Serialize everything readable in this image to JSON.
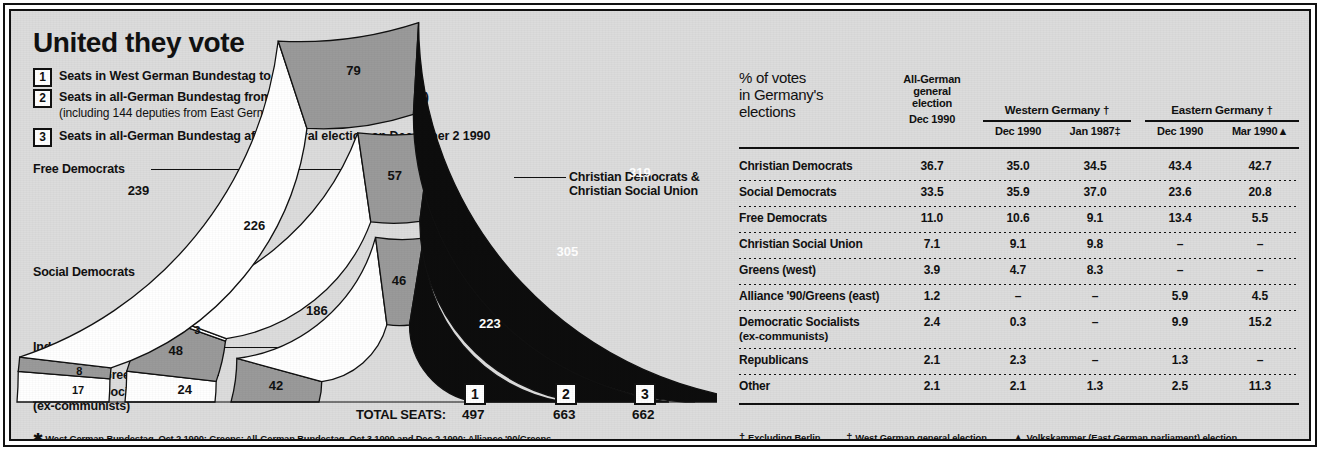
{
  "title": "United they vote",
  "key": [
    {
      "num": "1",
      "text": "Seats in West German Bundestag to October 2 1990",
      "sub": ""
    },
    {
      "num": "2",
      "text": "Seats in all-German Bundestag from October 3 1990 (unity day)",
      "sub": "(including 144 deputies from East Germany)"
    },
    {
      "num": "3",
      "text": "Seats in all-German Bundestag after general election on December 2 1990",
      "sub": ""
    }
  ],
  "chart_labels": {
    "free_democrats": "Free Democrats",
    "social_democrats": "Social Democrats",
    "independents": "Independents",
    "alliance_greens": "Alliance '90/Greens *",
    "democratic_socialists": "Democratic Socialists",
    "democratic_socialists_sub": "(ex-communists)",
    "christian_line1": "Christian Democrats &",
    "christian_line2": "Christian Social Union"
  },
  "total_seats_label": "TOTAL SEATS:",
  "ring_badges": [
    "1",
    "2",
    "3"
  ],
  "ring_totals": [
    "497",
    "663",
    "662"
  ],
  "left_footnote": "West German Bundestag, Oct 2 1990: Greens; All-German Bundestag, Oct 3 1990 and Dec 2 1990: Alliance '90/Greens",
  "left_footnote_marker": "✱",
  "chart_data": {
    "type": "pie",
    "title": "United they vote",
    "subtype": "nested half-donut (parliament seat shares)",
    "units": "seats",
    "rings": [
      {
        "badge": "1",
        "name": "Seats in West German Bundestag to October 2 1990",
        "total": 497,
        "radius_order": "inner",
        "segments": [
          {
            "label": "Democratic Socialists (ex-communists)",
            "value": 0,
            "display": "",
            "color": "#ffffff"
          },
          {
            "label": "Alliance '90/Greens",
            "value": 0,
            "display": "",
            "color": "#9a9a9a"
          },
          {
            "label": "Independents",
            "value": 0,
            "display": "",
            "color": "#ffffff"
          },
          {
            "label": "Greens / Alliance '90/Greens",
            "value": 42,
            "display": "42",
            "color": "#9a9a9a"
          },
          {
            "label": "Social Democrats",
            "value": 186,
            "display": "186",
            "color": "#ffffff"
          },
          {
            "label": "Free Democrats",
            "value": 46,
            "display": "46",
            "color": "#9a9a9a"
          },
          {
            "label": "Christian Democrats & Christian Social Union",
            "value": 223,
            "display": "223",
            "color": "#0d0d0d"
          }
        ]
      },
      {
        "badge": "2",
        "name": "Seats in all-German Bundestag from October 3 1990 (unity day)",
        "total": 663,
        "radius_order": "middle",
        "segments": [
          {
            "label": "Democratic Socialists (ex-communists)",
            "value": 24,
            "display": "24",
            "color": "#ffffff"
          },
          {
            "label": "Alliance '90/Greens",
            "value": 48,
            "display": "48",
            "color": "#9a9a9a"
          },
          {
            "label": "Independents",
            "value": 3,
            "display": "3",
            "color": "#ffffff"
          },
          {
            "label": "Social Democrats",
            "value": 226,
            "display": "226",
            "color": "#ffffff"
          },
          {
            "label": "Free Democrats",
            "value": 57,
            "display": "57",
            "color": "#9a9a9a"
          },
          {
            "label": "Christian Democrats & Christian Social Union",
            "value": 305,
            "display": "305",
            "color": "#0d0d0d"
          }
        ]
      },
      {
        "badge": "3",
        "name": "Seats in all-German Bundestag after general election on December 2 1990",
        "total": 662,
        "radius_order": "outer",
        "segments": [
          {
            "label": "Democratic Socialists (ex-communists)",
            "value": 17,
            "display": "17",
            "color": "#ffffff"
          },
          {
            "label": "Alliance '90/Greens",
            "value": 8,
            "display": "8",
            "color": "#9a9a9a"
          },
          {
            "label": "Social Democrats",
            "value": 239,
            "display": "239",
            "color": "#ffffff"
          },
          {
            "label": "Free Democrats",
            "value": 79,
            "display": "79",
            "color": "#9a9a9a"
          },
          {
            "label": "Christian Democrats & Christian Social Union",
            "value": 319,
            "display": "319",
            "color": "#0d0d0d"
          }
        ]
      }
    ],
    "legend": [
      {
        "label": "Free Democrats",
        "color": "#9a9a9a"
      },
      {
        "label": "Social Democrats",
        "color": "#ffffff"
      },
      {
        "label": "Independents",
        "color": "#ffffff"
      },
      {
        "label": "Alliance '90/Greens *",
        "color": "#9a9a9a"
      },
      {
        "label": "Democratic Socialists (ex-communists)",
        "color": "#ffffff"
      },
      {
        "label": "Christian Democrats & Christian Social Union",
        "color": "#0d0d0d"
      }
    ]
  },
  "table": {
    "corner_label": "% of votes\nin Germany's\nelections",
    "corner_lines": [
      "% of votes",
      "in Germany's",
      "elections"
    ],
    "col1_lines": [
      "All-German",
      "general",
      "election",
      "Dec 1990"
    ],
    "groups": [
      {
        "title": "Western Germany †",
        "cols": [
          "Dec 1990",
          "Jan 1987‡"
        ]
      },
      {
        "title": "Eastern Germany †",
        "cols": [
          "Dec 1990",
          "Mar 1990▲"
        ]
      }
    ],
    "rows": [
      {
        "name": "Christian Democrats",
        "sub": "",
        "values": [
          "36.7",
          "35.0",
          "34.5",
          "43.4",
          "42.7"
        ]
      },
      {
        "name": "Social Democrats",
        "sub": "",
        "values": [
          "33.5",
          "35.9",
          "37.0",
          "23.6",
          "20.8"
        ]
      },
      {
        "name": "Free Democrats",
        "sub": "",
        "values": [
          "11.0",
          "10.6",
          "9.1",
          "13.4",
          "5.5"
        ]
      },
      {
        "name": "Christian Social Union",
        "sub": "",
        "values": [
          "7.1",
          "9.1",
          "9.8",
          "–",
          "–"
        ]
      },
      {
        "name": "Greens (west)",
        "sub": "",
        "values": [
          "3.9",
          "4.7",
          "8.3",
          "–",
          "–"
        ]
      },
      {
        "name": "Alliance '90/Greens (east)",
        "sub": "",
        "values": [
          "1.2",
          "–",
          "–",
          "5.9",
          "4.5"
        ]
      },
      {
        "name": "Democratic Socialists",
        "sub": "(ex-communists)",
        "values": [
          "2.4",
          "0.3",
          "–",
          "9.9",
          "15.2"
        ]
      },
      {
        "name": "Republicans",
        "sub": "",
        "values": [
          "2.1",
          "2.3",
          "–",
          "1.3",
          "–"
        ]
      },
      {
        "name": "Other",
        "sub": "",
        "values": [
          "2.1",
          "2.1",
          "1.3",
          "2.5",
          "11.3"
        ]
      }
    ],
    "footnotes": [
      {
        "marker": "†",
        "text": "Excluding Berlin"
      },
      {
        "marker": "‡",
        "text": "West German general election"
      },
      {
        "marker": "▲",
        "text": "Volkskammer (East German parliament) election"
      }
    ]
  }
}
